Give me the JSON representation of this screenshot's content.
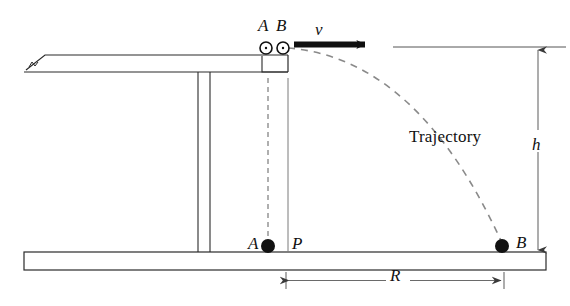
{
  "figure": {
    "type": "physics-mechanics-diagram",
    "width": 570,
    "height": 306,
    "background_color": "#ffffff",
    "line_color": "#2a2a2a",
    "ink_color": "#111111"
  },
  "labels": {
    "ball_a_top": "A",
    "ball_b_top": "B",
    "velocity": "v",
    "trajectory": "Trajectory",
    "height": "h",
    "ball_a_floor": "A",
    "point_p": "P",
    "ball_b_floor": "B",
    "range": "R"
  },
  "objects": {
    "table": {
      "name": "table",
      "top_surface_y": 55,
      "under_surface_y": 72,
      "left_x": 24,
      "right_x": 288,
      "leg_x": [
        198,
        210
      ],
      "leg_bottom_y": 252,
      "bevel": "left end tapers to a point"
    },
    "floor": {
      "name": "floor-slab",
      "x": 24,
      "y": 252,
      "width": 522,
      "height": 18,
      "fill": "#ffffff",
      "stroke": "#2a2a2a"
    },
    "ball_a_on_table": {
      "cx": 266,
      "cy": 48,
      "r": 6,
      "style": "open circle with center dot"
    },
    "ball_b_on_table": {
      "cx": 283,
      "cy": 48,
      "r": 6,
      "style": "open circle with center dot"
    },
    "ball_a_landed": {
      "cx": 268,
      "cy": 246,
      "r": 7,
      "style": "solid filled circle"
    },
    "ball_b_landed": {
      "cx": 502,
      "cy": 246,
      "r": 7,
      "style": "solid filled circle"
    },
    "velocity_arrow": {
      "x1": 296,
      "y1": 44,
      "x2": 372,
      "y2": 44,
      "style": "thick solid black arrow pointing right"
    },
    "drop_line_a": {
      "x": 268,
      "y1": 78,
      "y2": 243,
      "style": "dashed vertical"
    },
    "edge_line_p": {
      "x": 288,
      "y1": 78,
      "y2": 252,
      "style": "solid thin vertical"
    },
    "reference_line": {
      "x1": 393,
      "y1": 47,
      "x2": 566,
      "y2": 47,
      "style": "thin horizontal"
    },
    "height_dimension": {
      "x": 538,
      "y_top": 48,
      "y_bottom": 252,
      "style": "double-headed vertical dimension arrow"
    },
    "range_dimension": {
      "y": 280,
      "x_left": 286,
      "x_right": 504,
      "style": "double-headed horizontal dimension arrow with end ticks"
    },
    "trajectory_path": {
      "from": [
        288,
        48
      ],
      "to": [
        502,
        243
      ],
      "style": "dashed parabolic arc"
    }
  }
}
